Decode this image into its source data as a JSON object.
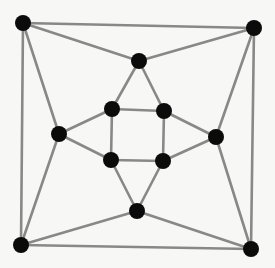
{
  "figure": {
    "background_color": "#f7f7f5",
    "edge_color": "#888886",
    "node_color": "#0b0b0b",
    "node_radius": 8,
    "edge_width": 2.6,
    "width": 275,
    "height": 268
  },
  "chart_data": {
    "type": "scatter",
    "title": "",
    "xlabel": "",
    "ylabel": "",
    "grid": false,
    "legend": "none",
    "xlim": [
      0,
      275
    ],
    "ylim": [
      0,
      268
    ],
    "graph_kind": "undirected",
    "vertex_count": 12,
    "edge_count": 18,
    "degree": 3,
    "nodes": [
      {
        "id": "outer-top-left",
        "label": "",
        "x": 23,
        "y": 23
      },
      {
        "id": "outer-top-right",
        "label": "",
        "x": 254,
        "y": 28
      },
      {
        "id": "outer-bottom-left",
        "label": "",
        "x": 21,
        "y": 245
      },
      {
        "id": "outer-bottom-right",
        "label": "",
        "x": 251,
        "y": 249
      },
      {
        "id": "mid-top",
        "label": "",
        "x": 139,
        "y": 61
      },
      {
        "id": "mid-left",
        "label": "",
        "x": 59,
        "y": 134
      },
      {
        "id": "mid-right",
        "label": "",
        "x": 216,
        "y": 137
      },
      {
        "id": "mid-bottom",
        "label": "",
        "x": 137,
        "y": 211
      },
      {
        "id": "inner-top-left",
        "label": "",
        "x": 112,
        "y": 109
      },
      {
        "id": "inner-top-right",
        "label": "",
        "x": 164,
        "y": 111
      },
      {
        "id": "inner-bottom-left",
        "label": "",
        "x": 111,
        "y": 160
      },
      {
        "id": "inner-bottom-right",
        "label": "",
        "x": 163,
        "y": 161
      }
    ],
    "edges": [
      {
        "from": "outer-top-left",
        "to": "outer-top-right"
      },
      {
        "from": "outer-top-left",
        "to": "outer-bottom-left"
      },
      {
        "from": "outer-bottom-left",
        "to": "outer-bottom-right"
      },
      {
        "from": "outer-top-right",
        "to": "outer-bottom-right"
      },
      {
        "from": "outer-top-left",
        "to": "mid-top"
      },
      {
        "from": "outer-top-right",
        "to": "mid-top"
      },
      {
        "from": "outer-top-left",
        "to": "mid-left"
      },
      {
        "from": "outer-bottom-left",
        "to": "mid-left"
      },
      {
        "from": "outer-top-right",
        "to": "mid-right"
      },
      {
        "from": "outer-bottom-right",
        "to": "mid-right"
      },
      {
        "from": "outer-bottom-left",
        "to": "mid-bottom"
      },
      {
        "from": "outer-bottom-right",
        "to": "mid-bottom"
      },
      {
        "from": "mid-top",
        "to": "inner-top-left"
      },
      {
        "from": "mid-top",
        "to": "inner-top-right"
      },
      {
        "from": "mid-left",
        "to": "inner-top-left"
      },
      {
        "from": "mid-left",
        "to": "inner-bottom-left"
      },
      {
        "from": "mid-right",
        "to": "inner-top-right"
      },
      {
        "from": "mid-right",
        "to": "inner-bottom-right"
      },
      {
        "from": "mid-bottom",
        "to": "inner-bottom-left"
      },
      {
        "from": "mid-bottom",
        "to": "inner-bottom-right"
      },
      {
        "from": "inner-top-left",
        "to": "inner-top-right"
      },
      {
        "from": "inner-top-left",
        "to": "inner-bottom-left"
      },
      {
        "from": "inner-bottom-left",
        "to": "inner-bottom-right"
      },
      {
        "from": "inner-top-right",
        "to": "inner-bottom-right"
      }
    ]
  }
}
